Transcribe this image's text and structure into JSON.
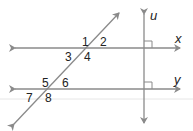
{
  "diagram": {
    "colors": {
      "line": "#8a8a8a",
      "text": "#222222",
      "faint": "#e6e6e6"
    },
    "lines": {
      "x": {
        "label": "x"
      },
      "y": {
        "label": "y"
      },
      "u": {
        "label": "u"
      }
    },
    "angles": [
      "1",
      "2",
      "3",
      "4",
      "5",
      "6",
      "7",
      "8"
    ]
  }
}
